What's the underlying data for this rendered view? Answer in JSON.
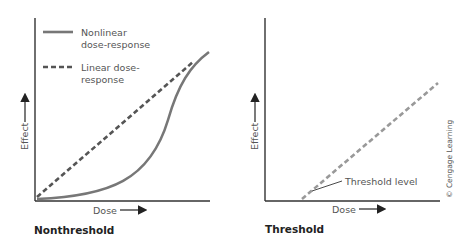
{
  "panels": [
    {
      "title": "Nonthreshold",
      "x_axis_label": "Dose",
      "y_axis_label": "Effect",
      "legend": [
        {
          "style": "solid",
          "label_line1": "Nonlinear",
          "label_line2": "dose-response"
        },
        {
          "style": "dashed",
          "label_line1": "Linear dose-",
          "label_line2": "response"
        }
      ]
    },
    {
      "title": "Threshold",
      "x_axis_label": "Dose",
      "y_axis_label": "Effect",
      "annotation": "Threshold level"
    }
  ],
  "credit": "© Cengage Learning",
  "colors": {
    "axis": "#333333",
    "curve": "#777777",
    "dashed_left": "#555555",
    "dashed_right": "#999999"
  }
}
